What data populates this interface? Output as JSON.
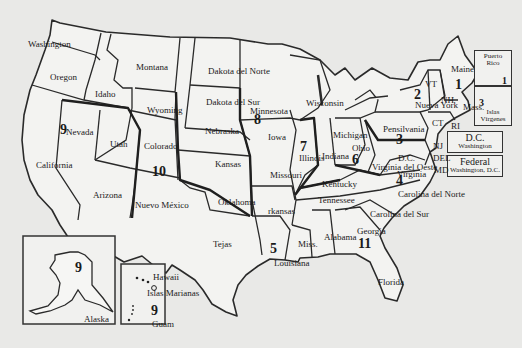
{
  "map": {
    "states": [
      {
        "name": "Washington",
        "x": 28,
        "y": 40
      },
      {
        "name": "Oregon",
        "x": 50,
        "y": 73
      },
      {
        "name": "Idaho",
        "x": 95,
        "y": 90
      },
      {
        "name": "Montana",
        "x": 136,
        "y": 63
      },
      {
        "name": "Wyoming",
        "x": 147,
        "y": 106
      },
      {
        "name": "Nevada",
        "x": 66,
        "y": 128
      },
      {
        "name": "Utah",
        "x": 110,
        "y": 140
      },
      {
        "name": "Colorado",
        "x": 144,
        "y": 142
      },
      {
        "name": "California",
        "x": 36,
        "y": 161
      },
      {
        "name": "Arizona",
        "x": 93,
        "y": 191
      },
      {
        "name": "Nuevo México",
        "x": 135,
        "y": 201
      },
      {
        "name": "Dakota del Norte",
        "x": 208,
        "y": 67
      },
      {
        "name": "Dakota del Sur",
        "x": 206,
        "y": 98
      },
      {
        "name": "Nebraska",
        "x": 205,
        "y": 127
      },
      {
        "name": "Kansas",
        "x": 215,
        "y": 160
      },
      {
        "name": "Oklahoma",
        "x": 218,
        "y": 198
      },
      {
        "name": "Tejas",
        "x": 213,
        "y": 240
      },
      {
        "name": "Minnesota",
        "x": 250,
        "y": 107
      },
      {
        "name": "Iowa",
        "x": 268,
        "y": 133
      },
      {
        "name": "Missouri",
        "x": 270,
        "y": 171
      },
      {
        "name": "rkansas",
        "x": 268,
        "y": 207
      },
      {
        "name": "Louisiana",
        "x": 274,
        "y": 259
      },
      {
        "name": "Wisconsin",
        "x": 306,
        "y": 99
      },
      {
        "name": "Illinois",
        "x": 299,
        "y": 154
      },
      {
        "name": "Indiana",
        "x": 322,
        "y": 152
      },
      {
        "name": "Michigan",
        "x": 333,
        "y": 131
      },
      {
        "name": "Ohio",
        "x": 352,
        "y": 144
      },
      {
        "name": "Kentucky",
        "x": 322,
        "y": 180
      },
      {
        "name": "Tennessee",
        "x": 318,
        "y": 196
      },
      {
        "name": "Miss.",
        "x": 298,
        "y": 240
      },
      {
        "name": "Alabama",
        "x": 324,
        "y": 233
      },
      {
        "name": "Georgia",
        "x": 357,
        "y": 227
      },
      {
        "name": "Florida",
        "x": 378,
        "y": 278
      },
      {
        "name": "Carolina del Norte",
        "x": 398,
        "y": 190
      },
      {
        "name": "Carolina del Sur",
        "x": 370,
        "y": 210
      },
      {
        "name": "Virginia del Oeste",
        "x": 372,
        "y": 163
      },
      {
        "name": "Virginia",
        "x": 397,
        "y": 170
      },
      {
        "name": "D.C.",
        "x": 398,
        "y": 154
      },
      {
        "name": "Pensilvania",
        "x": 383,
        "y": 125
      },
      {
        "name": "Nueva York",
        "x": 415,
        "y": 101
      },
      {
        "name": "VT",
        "x": 425,
        "y": 80
      },
      {
        "name": "NH",
        "x": 441,
        "y": 96
      },
      {
        "name": "Maine",
        "x": 451,
        "y": 65
      },
      {
        "name": "Mass.",
        "x": 463,
        "y": 103
      },
      {
        "name": "CT",
        "x": 432,
        "y": 119
      },
      {
        "name": "RI",
        "x": 451,
        "y": 122
      },
      {
        "name": "NJ",
        "x": 433,
        "y": 142
      },
      {
        "name": "DEL",
        "x": 433,
        "y": 154
      },
      {
        "name": "MD",
        "x": 434,
        "y": 166
      },
      {
        "name": "Alaska",
        "x": 84,
        "y": 315
      },
      {
        "name": "Hawaii",
        "x": 153,
        "y": 273
      },
      {
        "name": "Islas Marianas",
        "x": 147,
        "y": 289
      },
      {
        "name": "Guam",
        "x": 152,
        "y": 320
      }
    ],
    "regions": [
      {
        "number": "1",
        "x": 455,
        "y": 78
      },
      {
        "name": "2",
        "number": "2",
        "x": 414,
        "y": 88
      },
      {
        "number": "3",
        "x": 396,
        "y": 133
      },
      {
        "number": "4",
        "x": 396,
        "y": 174
      },
      {
        "number": "5",
        "x": 270,
        "y": 242
      },
      {
        "number": "6",
        "x": 352,
        "y": 153
      },
      {
        "number": "7",
        "x": 300,
        "y": 140
      },
      {
        "number": "8",
        "x": 254,
        "y": 113
      },
      {
        "number": "9",
        "x": 60,
        "y": 123
      },
      {
        "number": "10",
        "x": 152,
        "y": 165
      },
      {
        "number": "11",
        "x": 358,
        "y": 237
      },
      {
        "number": "9",
        "x": 75,
        "y": 261
      },
      {
        "number": "9",
        "x": 151,
        "y": 304
      }
    ],
    "insets": {
      "puerto_rico": {
        "label": "Puerto Rico",
        "number": "1"
      },
      "virgin_islands": {
        "label": "Islas Vírgenes",
        "number": "3"
      },
      "dc": {
        "title": "D.C.",
        "subtitle": "Washington"
      },
      "federal": {
        "title": "Federal",
        "subtitle": "Washington, D.C."
      }
    }
  }
}
